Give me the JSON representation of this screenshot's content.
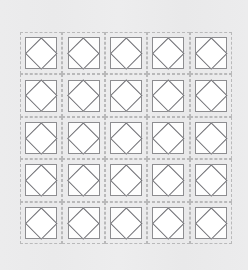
{
  "canvas": {
    "width": 248,
    "height": 270,
    "background_color": "#ebebec",
    "description": "quilt-block diagram: 5 by 5 grid of square-in-a-square units"
  },
  "grid": {
    "rows": 5,
    "columns": 5,
    "cell_count": 25,
    "left": 20,
    "top": 32,
    "width": 212,
    "height": 212,
    "cell_border_style": "dashed",
    "cell_border_color": "#b9b9ba"
  },
  "unit": {
    "outer_square_color": "#8d8d90",
    "outer_square_fill": "#fdfdfd",
    "diamond_color": "#6f6f74",
    "diamond_fill": "#ffffff",
    "shape_name": "square-in-a-square"
  },
  "cells": [
    {
      "row": 1,
      "col": 1
    },
    {
      "row": 1,
      "col": 2
    },
    {
      "row": 1,
      "col": 3
    },
    {
      "row": 1,
      "col": 4
    },
    {
      "row": 1,
      "col": 5
    },
    {
      "row": 2,
      "col": 1
    },
    {
      "row": 2,
      "col": 2
    },
    {
      "row": 2,
      "col": 3
    },
    {
      "row": 2,
      "col": 4
    },
    {
      "row": 2,
      "col": 5
    },
    {
      "row": 3,
      "col": 1
    },
    {
      "row": 3,
      "col": 2
    },
    {
      "row": 3,
      "col": 3
    },
    {
      "row": 3,
      "col": 4
    },
    {
      "row": 3,
      "col": 5
    },
    {
      "row": 4,
      "col": 1
    },
    {
      "row": 4,
      "col": 2
    },
    {
      "row": 4,
      "col": 3
    },
    {
      "row": 4,
      "col": 4
    },
    {
      "row": 4,
      "col": 5
    },
    {
      "row": 5,
      "col": 1
    },
    {
      "row": 5,
      "col": 2
    },
    {
      "row": 5,
      "col": 3
    },
    {
      "row": 5,
      "col": 4
    },
    {
      "row": 5,
      "col": 5
    }
  ]
}
